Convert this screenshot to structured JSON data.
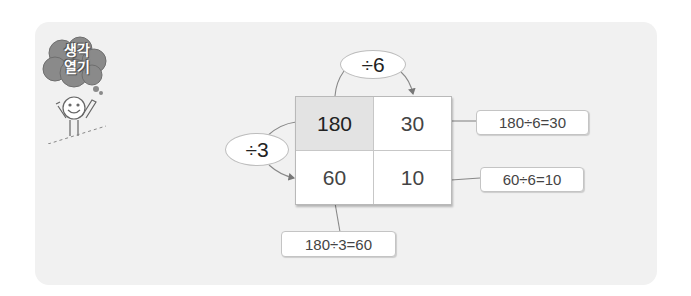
{
  "badge": {
    "text_line1": "생각",
    "text_line2": "열기",
    "icon": "thought-cloud-with-child"
  },
  "grid": {
    "cells": [
      {
        "value": "180",
        "highlighted": true
      },
      {
        "value": "30",
        "highlighted": false
      },
      {
        "value": "60",
        "highlighted": false
      },
      {
        "value": "10",
        "highlighted": false
      }
    ]
  },
  "operators": {
    "top": "÷6",
    "left": "÷3"
  },
  "callouts": {
    "row1": "180÷6=30",
    "row2": "60÷6=10",
    "col1": "180÷3=60"
  },
  "colors": {
    "panel": "#f1f1f1",
    "highlight_cell": "#e3e3e3",
    "border": "#b9b9b9",
    "arrow": "#777777"
  }
}
